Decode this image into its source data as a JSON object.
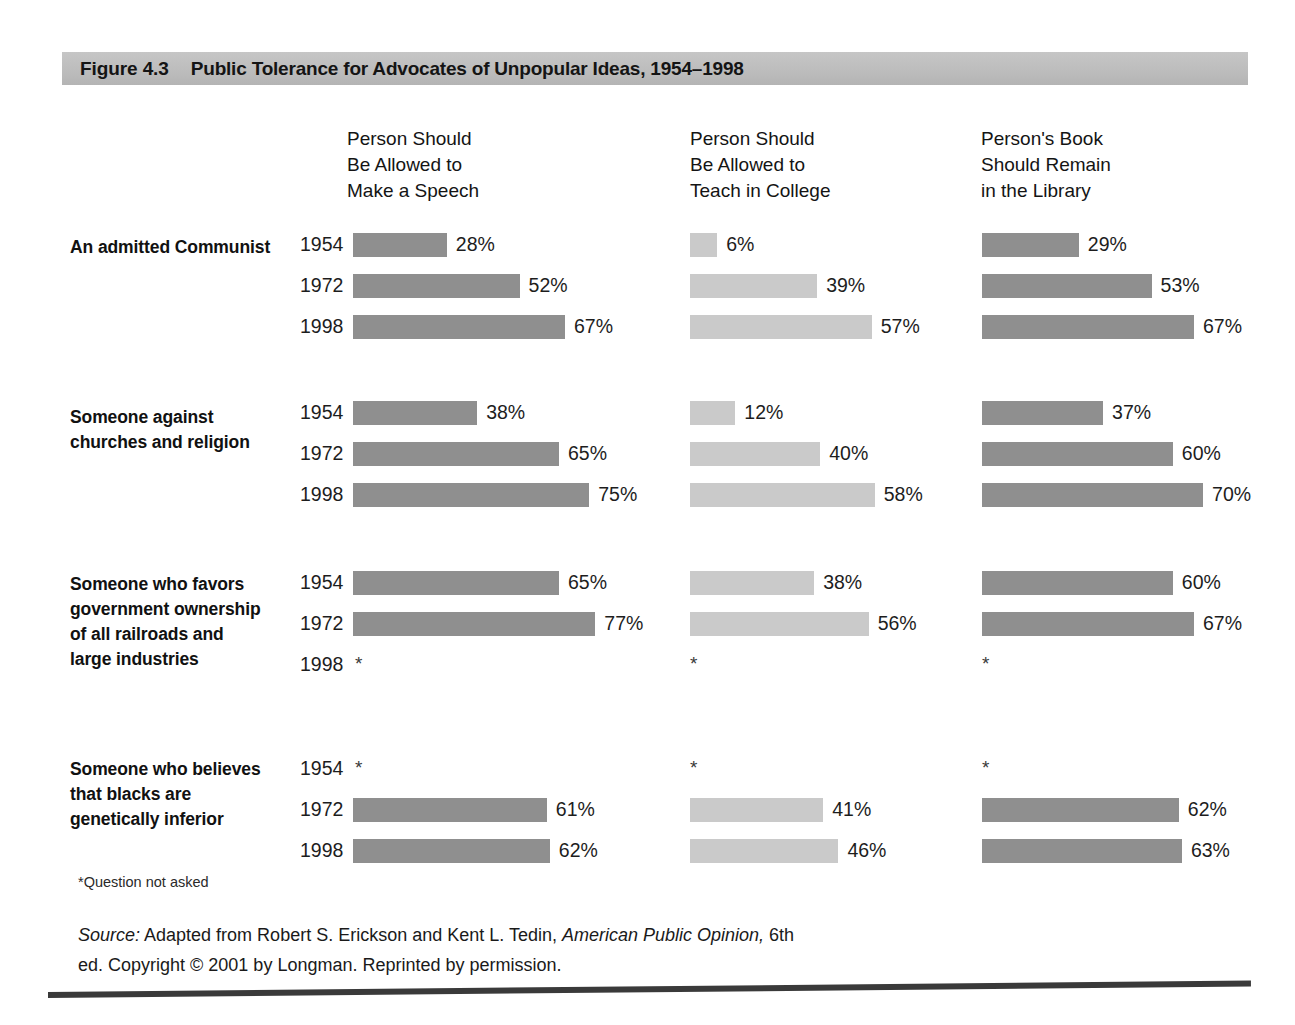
{
  "figure": {
    "number": "Figure 4.3",
    "title": "Public Tolerance for Advocates of Unpopular Ideas, 1954–1998"
  },
  "footnote": "*Question not asked",
  "source": {
    "label": "Source:",
    "text_before_book": " Adapted from Robert S. Erickson and Kent L. Tedin, ",
    "book": "American Public Opinion,",
    "text_after_book": " 6th ed. Copyright © 2001 by Longman. Reprinted by permission."
  },
  "colors": {
    "banner": "#bdbdbd",
    "bar_dark": "#8f8f8f",
    "bar_light": "#cacaca",
    "text": "#1a1a1a",
    "rule": "#3a3a3a"
  },
  "chart_data": {
    "type": "bar",
    "title": "Public Tolerance for Advocates of Unpopular Ideas, 1954–1998",
    "xlabel": "Percent",
    "ylabel": "",
    "xlim": [
      0,
      100
    ],
    "grid": false,
    "legend": "none",
    "orientation": "horizontal",
    "value_suffix": "%",
    "missing_marker": "*",
    "missing_note": "*Question not asked",
    "columns": [
      {
        "label": "Person Should\nBe Allowed to\nMake a Speech",
        "shade": "dark"
      },
      {
        "label": "Person Should\nBe Allowed to\nTeach in College",
        "shade": "light"
      },
      {
        "label": "Person's Book\nShould Remain\nin the Library",
        "shade": "dark"
      }
    ],
    "years": [
      "1954",
      "1972",
      "1998"
    ],
    "groups": [
      {
        "label": "An admitted Communist",
        "rows": [
          {
            "year": "1954",
            "values": [
              28,
              6,
              29
            ],
            "labels": [
              "28%",
              "6%",
              "29%"
            ]
          },
          {
            "year": "1972",
            "values": [
              52,
              39,
              53
            ],
            "labels": [
              "52%",
              "39%",
              "53%"
            ]
          },
          {
            "year": "1998",
            "values": [
              67,
              57,
              67
            ],
            "labels": [
              "67%",
              "57%",
              "67%"
            ]
          }
        ]
      },
      {
        "label": "Someone against\nchurches and religion",
        "rows": [
          {
            "year": "1954",
            "values": [
              38,
              12,
              37
            ],
            "labels": [
              "38%",
              "12%",
              "37%"
            ]
          },
          {
            "year": "1972",
            "values": [
              65,
              40,
              60
            ],
            "labels": [
              "65%",
              "40%",
              "60%"
            ]
          },
          {
            "year": "1998",
            "values": [
              75,
              58,
              70
            ],
            "labels": [
              "75%",
              "58%",
              "70%"
            ]
          }
        ]
      },
      {
        "label": "Someone who favors\ngovernment ownership\nof all railroads and\nlarge industries",
        "rows": [
          {
            "year": "1954",
            "values": [
              65,
              38,
              60
            ],
            "labels": [
              "65%",
              "38%",
              "60%"
            ]
          },
          {
            "year": "1972",
            "values": [
              77,
              56,
              67
            ],
            "labels": [
              "77%",
              "56%",
              "67%"
            ]
          },
          {
            "year": "1998",
            "values": [
              null,
              null,
              null
            ],
            "labels": [
              "*",
              "*",
              "*"
            ]
          }
        ]
      },
      {
        "label": "Someone who believes\nthat blacks are\ngenetically inferior",
        "rows": [
          {
            "year": "1954",
            "values": [
              null,
              null,
              null
            ],
            "labels": [
              "*",
              "*",
              "*"
            ]
          },
          {
            "year": "1972",
            "values": [
              61,
              41,
              62
            ],
            "labels": [
              "61%",
              "41%",
              "62%"
            ]
          },
          {
            "year": "1998",
            "values": [
              62,
              46,
              63
            ],
            "labels": [
              "62%",
              "46%",
              "63%"
            ]
          }
        ]
      }
    ]
  }
}
